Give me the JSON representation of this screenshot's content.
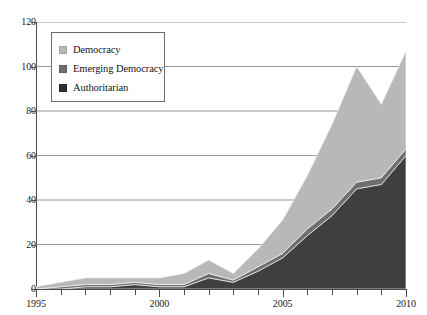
{
  "chart_data": {
    "type": "area",
    "stacked": true,
    "title": "",
    "subtitle": "",
    "xlabel": "",
    "ylabel": "",
    "xlim": [
      1995,
      2010
    ],
    "ylim": [
      0,
      120
    ],
    "ytick_step": 20,
    "ytick_labels": [
      "0",
      "20",
      "40",
      "60",
      "80",
      "100",
      "120"
    ],
    "ytick_values": [
      0,
      20,
      40,
      60,
      80,
      100,
      120
    ],
    "xtick_values": [
      1995,
      1996,
      1997,
      1998,
      1999,
      2000,
      2001,
      2002,
      2003,
      2004,
      2005,
      2006,
      2007,
      2008,
      2009,
      2010
    ],
    "xtick_labels_shown": [
      "1995",
      "2000",
      "2005",
      "2010"
    ],
    "xtick_labels_shown_values": [
      1995,
      2000,
      2005,
      2010
    ],
    "grid": "horizontal",
    "legend_position": "top-left-inside",
    "x": [
      1995,
      1996,
      1997,
      1998,
      1999,
      2000,
      2001,
      2002,
      2003,
      2004,
      2005,
      2006,
      2007,
      2008,
      2009,
      2010
    ],
    "series": [
      {
        "name": "Authoritarian",
        "color": "#3f3f3f",
        "values": [
          0,
          0,
          1,
          1,
          2,
          1,
          1,
          5,
          3,
          8,
          14,
          24,
          33,
          45,
          47,
          60
        ]
      },
      {
        "name": "Emerging Democracy",
        "color": "#6e6e6e",
        "values": [
          0,
          1,
          1,
          1,
          1,
          1,
          1,
          2,
          1,
          2,
          2,
          3,
          3,
          3,
          3,
          3
        ]
      },
      {
        "name": "Democracy",
        "color": "#b8b8b8",
        "values": [
          1,
          2,
          3,
          3,
          2,
          3,
          5,
          6,
          3,
          8,
          15,
          24,
          38,
          52,
          33,
          44
        ]
      }
    ],
    "stack_totals": [
      1,
      3,
      5,
      5,
      5,
      5,
      7,
      13,
      7,
      18,
      31,
      51,
      74,
      100,
      83,
      107
    ],
    "legend": [
      {
        "label": "Democracy",
        "color": "#b8b8b8"
      },
      {
        "label": "Emerging Democracy",
        "color": "#6e6e6e"
      },
      {
        "label": "Authoritarian",
        "color": "#2f2f2f"
      }
    ],
    "axis_color": "#4a4a4a",
    "grid_color": "#8a8a8a",
    "background": "#ffffff"
  }
}
